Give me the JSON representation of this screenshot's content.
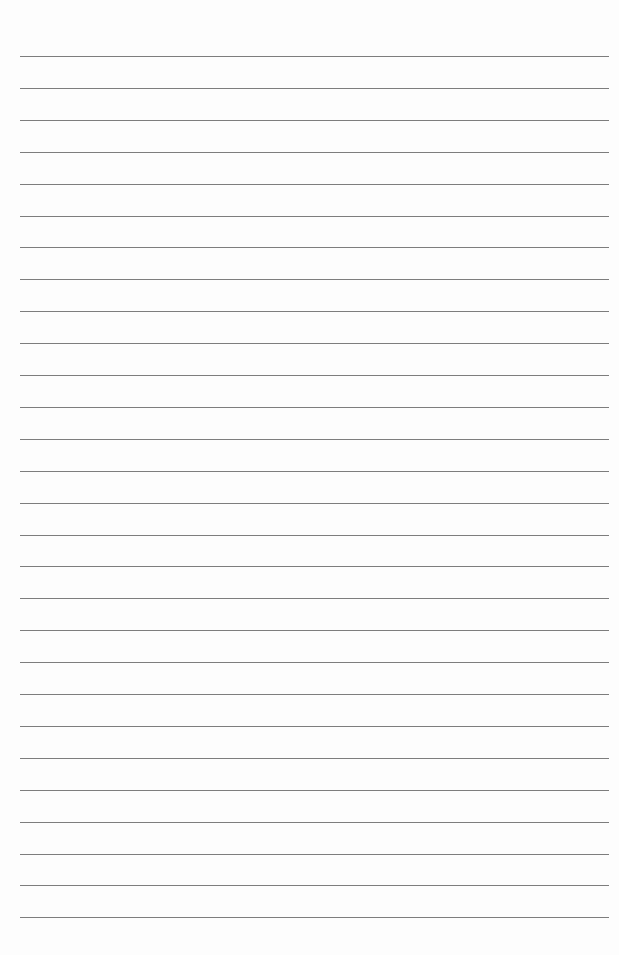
{
  "page": {
    "type": "lined-paper",
    "background": "#fdfdfd",
    "rule_color": "#7d7d7d",
    "rule_count": 28,
    "rule_first_y": 56,
    "rule_spacing": 31.9,
    "rule_left": 20,
    "rule_right": 609
  }
}
